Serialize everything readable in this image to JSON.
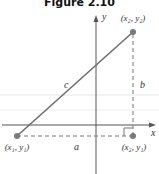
{
  "title": "Figure 2.10",
  "labels": {
    "y_axis": "y",
    "x_axis": "x",
    "point_top": "(x₂, y₂)",
    "point_left": "(x₁, y₁)",
    "point_corner": "(x₂, y₁)",
    "hypotenuse": "c",
    "vertical_leg": "b",
    "horizontal_leg": "a"
  },
  "colors": {
    "line": "#6e6e6e",
    "point": "#7a7a7a",
    "axis": "#555555",
    "guide": "#e6e6e6"
  }
}
